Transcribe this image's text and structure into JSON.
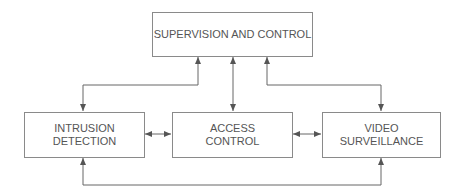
{
  "diagram": {
    "type": "block-diagram",
    "nodes": {
      "supervision": {
        "lines": [
          "SUPERVISION AND CONTROL"
        ]
      },
      "intrusion": {
        "lines": [
          "INTRUSION",
          "DETECTION"
        ]
      },
      "access": {
        "lines": [
          "ACCESS",
          "CONTROL"
        ]
      },
      "video": {
        "lines": [
          "VIDEO",
          "SURVEILLANCE"
        ]
      }
    },
    "edges": [
      {
        "from": "supervision",
        "to": "intrusion",
        "bidirectional": true
      },
      {
        "from": "supervision",
        "to": "access",
        "bidirectional": true
      },
      {
        "from": "supervision",
        "to": "video",
        "bidirectional": true
      },
      {
        "from": "intrusion",
        "to": "access",
        "bidirectional": true
      },
      {
        "from": "access",
        "to": "video",
        "bidirectional": true
      },
      {
        "from": "intrusion",
        "to": "video",
        "bidirectional": true
      }
    ],
    "colors": {
      "line": "#555555",
      "border": "#8a8a8a",
      "text": "#555555"
    }
  }
}
